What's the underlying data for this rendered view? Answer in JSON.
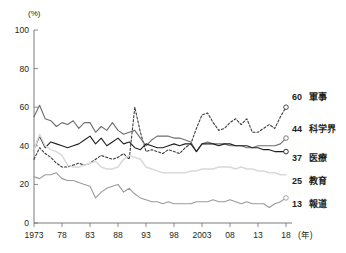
{
  "chart_data": {
    "type": "line",
    "title": "",
    "xlabel": "年",
    "ylabel": "(%)",
    "ylim": [
      0,
      100
    ],
    "xlim": [
      1973,
      2018
    ],
    "grid": false,
    "legend_position": "right-inline",
    "y_ticks": [
      "0",
      "20",
      "40",
      "60",
      "80",
      "100"
    ],
    "y_tick_values": [
      0,
      20,
      40,
      60,
      80,
      100
    ],
    "x_ticks": [
      "1973",
      "78",
      "83",
      "88",
      "93",
      "98",
      "2003",
      "08",
      "13",
      "18"
    ],
    "x_tick_values": [
      1973,
      1978,
      1983,
      1988,
      1993,
      1998,
      2003,
      2008,
      2013,
      2018
    ],
    "x_axis_unit": "(年)",
    "x": [
      1973,
      1974,
      1975,
      1976,
      1977,
      1978,
      1979,
      1980,
      1981,
      1982,
      1983,
      1984,
      1985,
      1986,
      1987,
      1988,
      1989,
      1990,
      1991,
      1992,
      1993,
      1994,
      1995,
      1996,
      1997,
      1998,
      1999,
      2000,
      2001,
      2002,
      2003,
      2004,
      2005,
      2006,
      2007,
      2008,
      2009,
      2010,
      2011,
      2012,
      2013,
      2014,
      2015,
      2016,
      2017,
      2018
    ],
    "series": [
      {
        "name": "軍事",
        "end_value": 60,
        "end_label": "60",
        "style": "dotted",
        "color": "#3b3b3b",
        "marker": "open-circle",
        "values": [
          33,
          39,
          36,
          34,
          31,
          29,
          29,
          30,
          31,
          30,
          31,
          33,
          35,
          34,
          33,
          34,
          36,
          33,
          60,
          47,
          37,
          38,
          37,
          36,
          38,
          37,
          36,
          39,
          41,
          49,
          56,
          57,
          52,
          48,
          49,
          52,
          54,
          51,
          54,
          47,
          47,
          49,
          51,
          49,
          55,
          60
        ]
      },
      {
        "name": "科学界",
        "end_value": 44,
        "end_label": "44",
        "style": "solid",
        "color": "#6d6e71",
        "marker": "open-circle",
        "values": [
          55,
          61,
          54,
          53,
          50,
          52,
          51,
          53,
          49,
          52,
          52,
          47,
          50,
          48,
          52,
          48,
          46,
          47,
          48,
          44,
          40,
          43,
          45,
          45,
          45,
          44,
          44,
          43,
          42,
          37,
          41,
          42,
          41,
          41,
          41,
          40,
          40,
          40,
          39,
          39,
          40,
          40,
          40,
          40,
          41,
          44
        ]
      },
      {
        "name": "医療",
        "end_value": 37,
        "end_label": "37",
        "style": "solid",
        "color": "#231f20",
        "marker": "open-circle",
        "values": [
          38,
          45,
          39,
          42,
          41,
          40,
          39,
          40,
          41,
          43,
          45,
          41,
          44,
          40,
          42,
          44,
          41,
          42,
          39,
          38,
          41,
          40,
          39,
          39,
          40,
          41,
          40,
          41,
          41,
          37,
          41,
          41,
          41,
          40,
          41,
          41,
          40,
          40,
          40,
          39,
          39,
          38,
          38,
          37,
          37,
          37
        ]
      },
      {
        "name": "教育",
        "end_value": 25,
        "end_label": "25",
        "style": "solid",
        "color": "#d9d9d9",
        "marker": "none",
        "values": [
          38,
          46,
          40,
          38,
          37,
          35,
          30,
          29,
          29,
          30,
          31,
          32,
          29,
          28,
          28,
          29,
          33,
          35,
          34,
          33,
          29,
          28,
          27,
          26,
          26,
          26,
          26,
          26,
          27,
          27,
          28,
          28,
          28,
          29,
          29,
          29,
          28,
          29,
          28,
          28,
          27,
          27,
          26,
          26,
          25,
          25
        ]
      },
      {
        "name": "報道",
        "end_value": 13,
        "end_label": "13",
        "style": "solid",
        "color": "#9a9a9a",
        "marker": "open-circle",
        "values": [
          24,
          23,
          25,
          25,
          26,
          23,
          22,
          22,
          21,
          20,
          19,
          13,
          16,
          18,
          19,
          20,
          16,
          18,
          15,
          13,
          12,
          11,
          11,
          10,
          11,
          10,
          10,
          10,
          10,
          11,
          11,
          11,
          12,
          11,
          11,
          12,
          11,
          10,
          11,
          10,
          10,
          10,
          8,
          10,
          11,
          13
        ]
      }
    ]
  }
}
